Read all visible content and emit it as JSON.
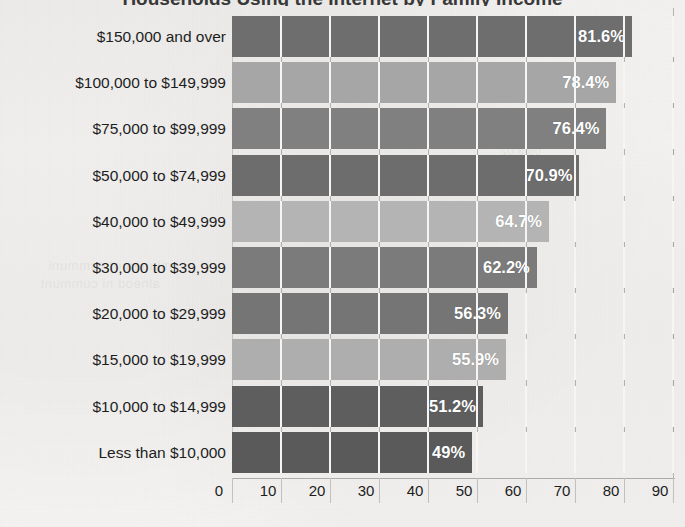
{
  "chart_data": {
    "type": "bar",
    "orientation": "horizontal",
    "title": "",
    "title_note": "title cropped off at top edge of scan",
    "xlabel": "",
    "ylabel": "",
    "xlim": [
      0,
      90
    ],
    "grid": true,
    "legend": "none",
    "xticks": [
      "0",
      "10",
      "20",
      "30",
      "40",
      "50",
      "60",
      "70",
      "80",
      "90"
    ],
    "categories": [
      "$150,000 and over",
      "$100,000 to $149,999",
      "$75,000 to $99,999",
      "$50,000 to $74,999",
      "$40,000 to $49,999",
      "$30,000 to $39,999",
      "$20,000 to $29,999",
      "$15,000 to $19,999",
      "$10,000 to $14,999",
      "Less than $10,000"
    ],
    "values": [
      81.6,
      78.4,
      76.4,
      70.9,
      64.7,
      62.2,
      56.3,
      55.9,
      51.2,
      49
    ],
    "data_labels": [
      "81.6%",
      "78.4%",
      "76.4%",
      "70.9%",
      "64.7%",
      "62.2%",
      "56.3%",
      "55.9%",
      "51.2%",
      "49%"
    ],
    "bar_colors": [
      "#6e6e6e",
      "#a6a6a6",
      "#808080",
      "#6d6d6d",
      "#b4b4b4",
      "#7b7b7b",
      "#757575",
      "#aeaeae",
      "#5e5e5e",
      "#5a5a5a"
    ],
    "colors": {
      "background": "#f4f3f1",
      "label_text": "#1d1d1d",
      "value_text": "#ffffff",
      "gridline": "#f6f5f3",
      "axis_line": "#adacaa"
    }
  }
}
